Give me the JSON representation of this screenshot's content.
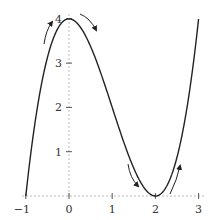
{
  "chart_data": {
    "type": "line",
    "title": "",
    "xlabel": "",
    "ylabel": "",
    "function": "y = x^3 - 3x^2 + 4",
    "xlim": [
      -1,
      3
    ],
    "ylim": [
      0,
      4
    ],
    "x_ticks": [
      "-1",
      "0",
      "1",
      "2",
      "3"
    ],
    "y_ticks": [
      "1",
      "2",
      "3",
      "4"
    ],
    "grid": false,
    "series": [
      {
        "name": "curve",
        "x": [
          -1,
          -0.5,
          0,
          0.5,
          1,
          1.5,
          2,
          2.5,
          3
        ],
        "y": [
          0,
          3.125,
          4,
          3.375,
          2,
          0.625,
          0,
          0.875,
          4
        ]
      }
    ],
    "annotations": [
      {
        "type": "arrow",
        "description": "increasing arrow before local max at (0,4)"
      },
      {
        "type": "arrow",
        "description": "decreasing arrow after local max at (0,4)"
      },
      {
        "type": "arrow",
        "description": "decreasing arrow before local min at (2,0)"
      },
      {
        "type": "arrow",
        "description": "increasing arrow after local min at (2,0)"
      }
    ],
    "key_points": {
      "local_max": [
        0,
        4
      ],
      "local_min": [
        2,
        0
      ]
    }
  }
}
